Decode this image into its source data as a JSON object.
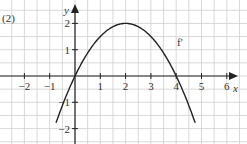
{
  "figure": {
    "panel_label": "(2)",
    "curve_label": "f'",
    "x_axis_label": "x",
    "y_axis_label": "y"
  },
  "chart_data": {
    "type": "line",
    "title": "(2)",
    "xlabel": "x",
    "ylabel": "y",
    "xlim": [
      -2.9,
      6.6
    ],
    "ylim": [
      -2.6,
      2.8
    ],
    "grid": true,
    "x_ticks": [
      "-2",
      "-1",
      "1",
      "2",
      "3",
      "4",
      "5",
      "6"
    ],
    "y_ticks": [
      "2",
      "1",
      "-1",
      "-2"
    ],
    "series": [
      {
        "name": "f'",
        "description": "Downward parabola y = -0.5x^2 + 2x, roots at x=0 and x=4, vertex (2,2)",
        "x": [
          -0.75,
          -0.5,
          0,
          0.5,
          1,
          1.5,
          2,
          2.5,
          3,
          3.5,
          4,
          4.5,
          4.75
        ],
        "values": [
          -1.78,
          -1.125,
          0,
          0.875,
          1.5,
          1.875,
          2,
          1.875,
          1.5,
          0.875,
          0,
          -1.125,
          -1.78
        ]
      }
    ]
  }
}
